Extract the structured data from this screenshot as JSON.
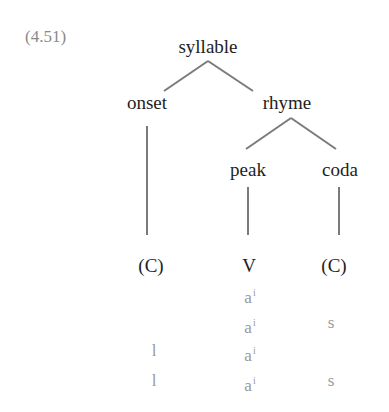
{
  "example_number": "(4.51)",
  "tree": {
    "root": "syllable",
    "onset": "onset",
    "rhyme": "rhyme",
    "peak": "peak",
    "coda": "coda"
  },
  "slots": {
    "onset": "(C)",
    "peak": "V",
    "coda": "(C)"
  },
  "rows": [
    {
      "onset": "",
      "peak_base": "a",
      "peak_sup": "i",
      "coda": ""
    },
    {
      "onset": "",
      "peak_base": "a",
      "peak_sup": "i",
      "coda": "s"
    },
    {
      "onset": "l",
      "peak_base": "a",
      "peak_sup": "i",
      "coda": ""
    },
    {
      "onset": "l",
      "peak_base": "a",
      "peak_sup": "i",
      "coda": "s"
    }
  ],
  "colors": {
    "node_text": "#1e1e1e",
    "branch": "#7a7a7a",
    "example_text": "#8a8a8a",
    "segment_text": "#9a9a9a"
  }
}
